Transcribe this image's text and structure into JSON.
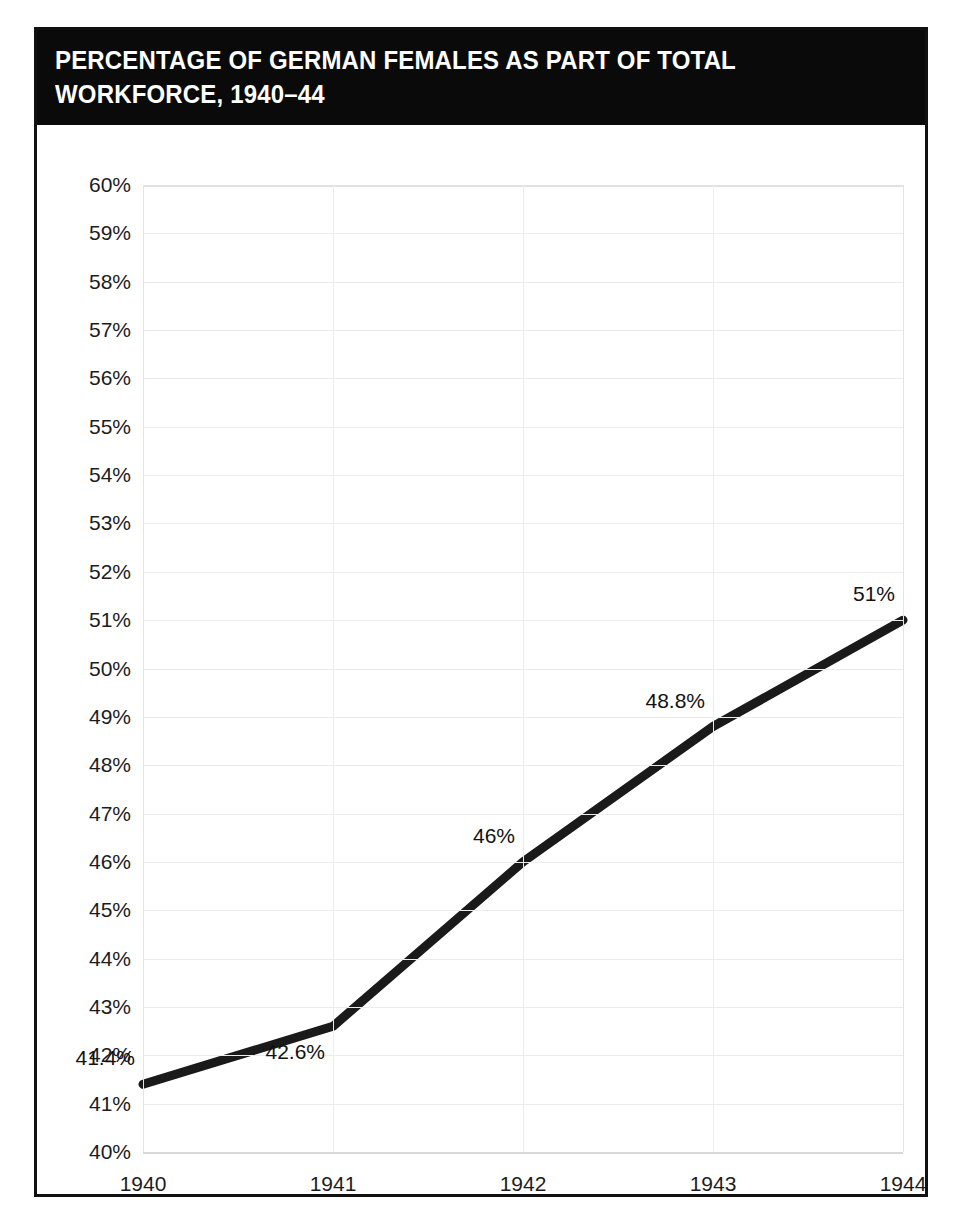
{
  "card": {
    "title_line1": "PERCENTAGE OF GERMAN FEMALES AS PART OF TOTAL WORKFORCE,",
    "title_line2": "1940–44",
    "title_full": "PERCENTAGE OF GERMAN FEMALES AS PART OF TOTAL WORKFORCE, 1940–44",
    "title_bar_color": "#0a0a0a",
    "border_color": "#111111",
    "background_color": "#ffffff"
  },
  "chart_data": {
    "type": "line",
    "title": "PERCENTAGE OF GERMAN FEMALES AS PART OF TOTAL WORKFORCE, 1940–44",
    "xlabel": "",
    "ylabel": "",
    "categories": [
      "1940",
      "1941",
      "1942",
      "1943",
      "1944"
    ],
    "x": [
      1940,
      1941,
      1942,
      1943,
      1944
    ],
    "values": [
      41.4,
      42.6,
      46,
      48.8,
      51
    ],
    "point_labels": [
      "41.4%",
      "42.6%",
      "46%",
      "48.8%",
      "51%"
    ],
    "ylim": [
      40,
      60
    ],
    "ytick_step": 1,
    "ytick_labels": [
      "60%",
      "59%",
      "58%",
      "57%",
      "56%",
      "55%",
      "54%",
      "53%",
      "52%",
      "51%",
      "50%",
      "49%",
      "48%",
      "47%",
      "46%",
      "45%",
      "44%",
      "43%",
      "42%",
      "41%",
      "40%"
    ],
    "ytick_values": [
      60,
      59,
      58,
      57,
      56,
      55,
      54,
      53,
      52,
      51,
      50,
      49,
      48,
      47,
      46,
      45,
      44,
      43,
      42,
      41,
      40
    ],
    "xtick_labels": [
      "1940",
      "1941",
      "1942",
      "1943",
      "1944"
    ],
    "grid": true,
    "legend": false,
    "legend_position": "none",
    "series_color": "#1a1a1a",
    "series_width_px": 9,
    "gridline_color": "#ececec",
    "label_positions": [
      {
        "label": "41.4%",
        "anchor": "above-left"
      },
      {
        "label": "42.6%",
        "anchor": "below-left"
      },
      {
        "label": "46%",
        "anchor": "above-left"
      },
      {
        "label": "48.8%",
        "anchor": "above-left"
      },
      {
        "label": "51%",
        "anchor": "above-left"
      }
    ]
  }
}
